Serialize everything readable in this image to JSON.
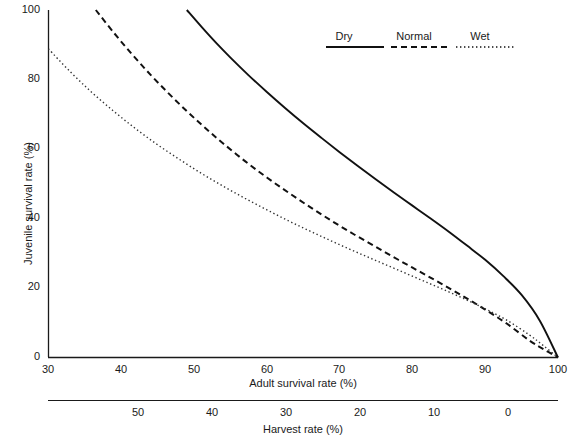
{
  "chart_data": {
    "type": "line",
    "title": "",
    "xlabel": "Adult survival rate (%)",
    "ylabel": "Juvenile survival rate (%)",
    "secondary_xlabel": "Harvest rate (%)",
    "xlim": [
      30,
      100
    ],
    "ylim": [
      0,
      100
    ],
    "xticks": [
      30,
      40,
      50,
      60,
      70,
      80,
      90,
      100
    ],
    "xticklabels": [
      "30",
      "40",
      "50",
      "60",
      "70",
      "80",
      "90",
      "100"
    ],
    "yticks": [
      0,
      20,
      40,
      60,
      80,
      100
    ],
    "yticklabels": [
      "0",
      "20",
      "40",
      "60",
      "80",
      "100"
    ],
    "secondary_xticks": [
      50,
      40,
      30,
      20,
      10,
      0
    ],
    "secondary_xticklabels": [
      "50",
      "40",
      "30",
      "20",
      "10",
      "0"
    ],
    "grid": false,
    "legend_position": "top-right",
    "axis_color": "#1a1a1a",
    "series": [
      {
        "name": "Dry",
        "style": "solid",
        "color": "#111111",
        "x": [
          49.0,
          51.0,
          53.0,
          55.0,
          57.5,
          60.0,
          62.5,
          65.0,
          67.5,
          70.0,
          72.5,
          75.0,
          77.5,
          80.0,
          82.5,
          85.0,
          87.5,
          90.0,
          92.5,
          95.0,
          97.5,
          100.0
        ],
        "y": [
          100.0,
          95.2,
          90.6,
          86.3,
          81.2,
          76.4,
          71.8,
          67.4,
          63.2,
          59.1,
          55.1,
          51.2,
          47.4,
          43.7,
          40.0,
          36.2,
          32.2,
          28.1,
          23.4,
          18.0,
          10.6,
          0.0
        ]
      },
      {
        "name": "Normal",
        "style": "dashed",
        "color": "#111111",
        "x": [
          36.5,
          39.0,
          41.5,
          44.0,
          46.5,
          49.0,
          51.5,
          54.0,
          57.0,
          60.0,
          63.0,
          66.0,
          69.0,
          72.0,
          75.0,
          78.0,
          81.0,
          84.0,
          87.0,
          90.0,
          93.0,
          96.0,
          98.0,
          100.0
        ],
        "y": [
          100.0,
          93.4,
          87.2,
          81.4,
          76.0,
          70.9,
          66.1,
          61.6,
          56.5,
          51.8,
          47.4,
          43.2,
          39.2,
          35.4,
          31.8,
          28.2,
          24.7,
          21.2,
          17.6,
          13.8,
          9.7,
          5.0,
          2.4,
          0.0
        ]
      },
      {
        "name": "Wet",
        "style": "dotted",
        "color": "#333333",
        "x": [
          30.0,
          33.0,
          36.0,
          39.0,
          42.0,
          45.0,
          48.0,
          51.0,
          54.0,
          57.0,
          60.0,
          63.0,
          66.0,
          69.0,
          72.0,
          75.0,
          78.0,
          81.0,
          84.0,
          87.0,
          90.0,
          93.0,
          96.0,
          98.0,
          100.0
        ],
        "y": [
          88.8,
          82.2,
          76.2,
          70.8,
          65.8,
          61.2,
          57.0,
          53.0,
          49.3,
          45.8,
          42.5,
          39.3,
          36.3,
          33.4,
          30.6,
          27.9,
          25.2,
          22.5,
          19.8,
          17.0,
          14.0,
          10.7,
          6.6,
          3.4,
          0.0
        ]
      }
    ]
  },
  "legend": {
    "items": [
      {
        "label": "Dry",
        "style": "solid"
      },
      {
        "label": "Normal",
        "style": "dashed"
      },
      {
        "label": "Wet",
        "style": "dotted"
      }
    ]
  },
  "axes": {
    "y_title": "Juvenile survival rate (%)",
    "x_title": "Adult survival rate (%)",
    "secondary_x_title": "Harvest rate (%)"
  },
  "yticks": {
    "t0": "0",
    "t20": "20",
    "t40": "40",
    "t60": "60",
    "t80": "80",
    "t100": "100"
  },
  "xticks": {
    "t30": "30",
    "t40": "40",
    "t50": "50",
    "t60": "60",
    "t70": "70",
    "t80": "80",
    "t90": "90",
    "t100": "100"
  },
  "harvestticks": {
    "h50": "50",
    "h40": "40",
    "h30": "30",
    "h20": "20",
    "h10": "10",
    "h0": "0"
  }
}
